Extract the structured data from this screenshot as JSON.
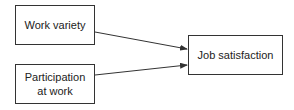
{
  "diagram": {
    "nodes": [
      {
        "id": "work_variety",
        "label": "Work variety"
      },
      {
        "id": "participation",
        "label": "Participation at work"
      },
      {
        "id": "job_satisfaction",
        "label": "Job satisfaction"
      }
    ],
    "edges": [
      {
        "from": "work_variety",
        "to": "job_satisfaction"
      },
      {
        "from": "participation",
        "to": "job_satisfaction"
      }
    ]
  }
}
